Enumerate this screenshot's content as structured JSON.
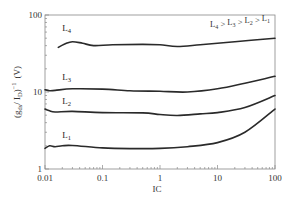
{
  "chart_data": {
    "type": "line",
    "title": "",
    "xlabel": "IC",
    "ylabel": "(g_ds / I_D)^-1 (V)",
    "xscale": "log",
    "yscale": "log",
    "xlim": [
      0.01,
      100
    ],
    "ylim": [
      1,
      100
    ],
    "xticks": [
      {
        "value": 0.01,
        "label": "0.01"
      },
      {
        "value": 0.1,
        "label": "0.1"
      },
      {
        "value": 1,
        "label": "1"
      },
      {
        "value": 10,
        "label": "10"
      },
      {
        "value": 100,
        "label": "100"
      }
    ],
    "yticks": [
      {
        "value": 1,
        "label": "1"
      },
      {
        "value": 10,
        "label": "10"
      },
      {
        "value": 100,
        "label": "100"
      }
    ],
    "grid": false,
    "annotation": "L4 > L3 > L2 > L1",
    "annotation_parts": {
      "L": "L",
      "gt": " > ",
      "subs": [
        "4",
        "3",
        "2",
        "1"
      ]
    },
    "ylabel_parts": {
      "open": "(g",
      "sub": "ds",
      "mid": "/ I",
      "sub2": "D",
      "close": ")",
      "sup": "−1",
      "unit": "(V)"
    },
    "series": [
      {
        "name": "L4",
        "label_main": "L",
        "label_sub": "4",
        "label_at": [
          0.02,
          62
        ],
        "x": [
          0.017,
          0.022,
          0.03,
          0.045,
          0.07,
          0.15,
          0.5,
          1.0,
          2.0,
          5.0,
          20,
          100
        ],
        "y": [
          38,
          42,
          45,
          43,
          40,
          41,
          41.5,
          41,
          39,
          41,
          45,
          50
        ]
      },
      {
        "name": "L3",
        "label_main": "L",
        "label_sub": "3",
        "label_at": [
          0.02,
          14.5
        ],
        "x": [
          0.01,
          0.012,
          0.015,
          0.03,
          0.1,
          0.3,
          1.0,
          3.0,
          10,
          30,
          100
        ],
        "y": [
          10.7,
          10.4,
          10.5,
          11.0,
          10.9,
          10.4,
          10.2,
          10.0,
          11.0,
          13.0,
          16.0
        ]
      },
      {
        "name": "L2",
        "label_main": "L",
        "label_sub": "2",
        "label_at": [
          0.02,
          6.9
        ],
        "x": [
          0.01,
          0.012,
          0.015,
          0.03,
          0.1,
          0.5,
          1.0,
          2.0,
          5.0,
          10,
          30,
          100
        ],
        "y": [
          6.0,
          5.7,
          5.5,
          5.6,
          5.4,
          5.35,
          5.1,
          4.95,
          5.2,
          5.4,
          6.3,
          9.0
        ]
      },
      {
        "name": "L1",
        "label_main": "L",
        "label_sub": "1",
        "label_at": [
          0.02,
          2.55
        ],
        "x": [
          0.01,
          0.012,
          0.015,
          0.02,
          0.03,
          0.1,
          0.3,
          1.0,
          3.0,
          10,
          30,
          100
        ],
        "y": [
          1.85,
          2.0,
          1.95,
          2.0,
          2.02,
          1.88,
          1.84,
          1.85,
          1.95,
          2.2,
          3.0,
          6.0
        ]
      }
    ]
  }
}
